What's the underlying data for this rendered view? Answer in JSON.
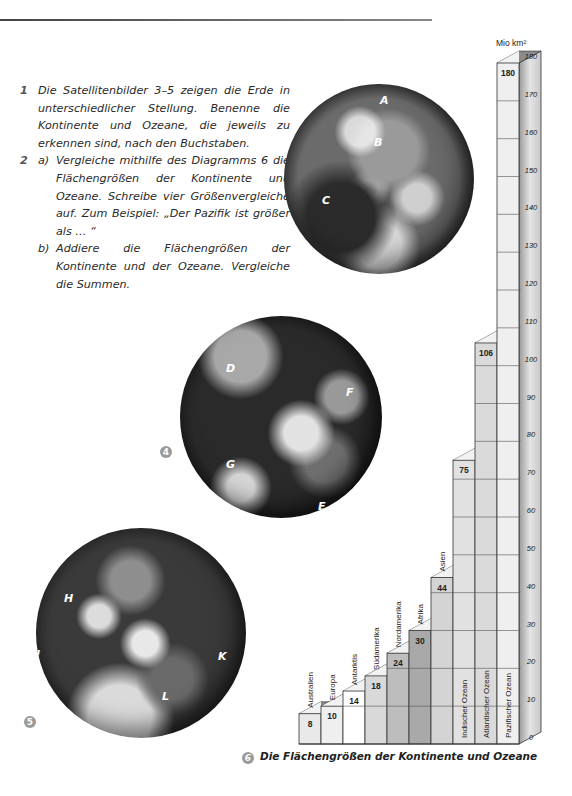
{
  "tasks": [
    {
      "number": "1",
      "text": "Die Satellitenbilder 3–5 zeigen die Erde in unterschiedlicher Stellung. Benenne die Kontinente und Ozeane, die jeweils zu erkennen sind, nach den Buchstaben."
    },
    {
      "number": "2",
      "subtasks": [
        {
          "label": "a)",
          "text": "Vergleiche mithilfe des Diagramms 6 die Flächengrößen der Kontinente und Ozeane. Schreibe vier Größenvergleiche auf. Zum Beispiel: „Der Pazifik ist größer als … “"
        },
        {
          "label": "b)",
          "text": "Addiere die Flächengrößen der Kontinente und der Ozeane. Vergleiche die Summen."
        }
      ]
    }
  ],
  "figures": {
    "fig3": {
      "number": "3",
      "labels": [
        "A",
        "B",
        "C"
      ]
    },
    "fig4": {
      "number": "4",
      "labels": [
        "D",
        "F",
        "G",
        "E"
      ]
    },
    "fig5": {
      "number": "5",
      "labels": [
        "H",
        "I",
        "K",
        "L"
      ]
    },
    "fig6": {
      "number": "6",
      "caption": "Die Flächengrößen der Kontinente und Ozeane"
    }
  },
  "chart_data": {
    "type": "bar",
    "title": "Die Flächengrößen der Kontinente und Ozeane",
    "ylabel": "Mio km²",
    "xlabel": "",
    "ylim": [
      0,
      180
    ],
    "yticks": [
      0,
      10,
      20,
      30,
      40,
      50,
      60,
      70,
      80,
      90,
      100,
      110,
      120,
      130,
      140,
      150,
      160,
      170,
      180
    ],
    "categories": [
      "Australien",
      "Europa",
      "Antarktis",
      "Südamerika",
      "Nordamerika",
      "Afrika",
      "Asien",
      "Indischer Ozean",
      "Atlantischer Ozean",
      "Pazifischer Ozean"
    ],
    "values": [
      8,
      10,
      14,
      18,
      24,
      30,
      44,
      75,
      106,
      180
    ],
    "fills": [
      "#e9e9e9",
      "#efefef",
      "#ffffff",
      "#d9d9d9",
      "#bdbdbd",
      "#a9a9a9",
      "#d4d4d4",
      "#e1e1e1",
      "#dadada",
      "#efefef"
    ],
    "style": "3D stepped columns, value label at top of each column, category name rotated vertically",
    "grid": true
  }
}
